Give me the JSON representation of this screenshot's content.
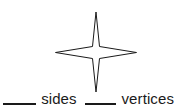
{
  "worksheet": {
    "shape": {
      "name": "four-pointed-star",
      "description": "4-pointed concave star outline",
      "stroke_color": "#1a1a1a",
      "fill_color": "#ffffff",
      "points": 4
    },
    "background_color": "#ffffff",
    "question": {
      "blank_1_answer": "",
      "label_1": "sides",
      "blank_2_answer": "",
      "label_2": "vertices"
    }
  }
}
